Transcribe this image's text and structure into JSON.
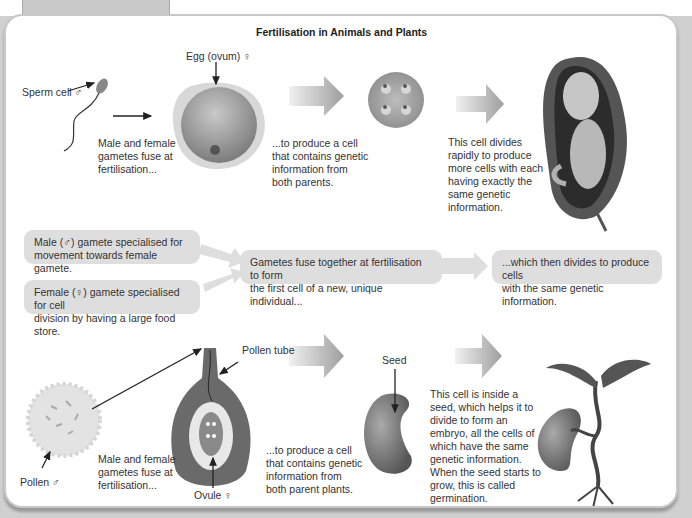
{
  "page": {
    "section_tab": "Fertilisation",
    "title": "Fertilisation in Animals and Plants"
  },
  "animals": {
    "sperm_label": "Sperm cell ♂",
    "egg_label": "Egg (ovum) ♀",
    "fuse_text": [
      "Male and female",
      "gametes fuse at",
      "fertilisation..."
    ],
    "produce_text": [
      "...to produce a cell",
      "that contains genetic",
      "information from",
      "both parents."
    ],
    "divides_text": [
      "This cell divides",
      "rapidly to produce",
      "more cells with each",
      "having exactly the",
      "same genetic",
      "information."
    ]
  },
  "summary": {
    "male_box": [
      "Male (♂) gamete specialised for",
      "movement towards female gamete."
    ],
    "female_box": [
      "Female (♀) gamete specialised for cell",
      "division by having a large food store."
    ],
    "fuse_box": [
      "Gametes fuse together at fertilisation to form",
      "the first cell of a new, unique individual..."
    ],
    "divide_box": [
      "...which then divides to produce cells",
      "with the same genetic information."
    ]
  },
  "plants": {
    "pollen_label": "Pollen ♂",
    "pollen_tube_label": "Pollen tube",
    "ovule_label": "Ovule ♀",
    "seed_label": "Seed",
    "fuse_text": [
      "Male and female",
      "gametes fuse at",
      "fertilisation..."
    ],
    "produce_text": [
      "...to produce a cell",
      "that contains genetic",
      "information from",
      "both parent plants."
    ],
    "seed_text": [
      "This cell is inside a",
      "seed, which helps it to",
      "divide to form an",
      "embryo, all the cells of",
      "which have the same",
      "genetic information.",
      "When the seed starts to",
      "grow, this is called",
      "germination."
    ]
  },
  "colors": {
    "panel_border": "#c8c8c8",
    "box_fill": "#dedede",
    "arrow_gray": "#a0a0a0",
    "cell_gray": "#8f8f8f",
    "leaf_dark": "#555555"
  }
}
